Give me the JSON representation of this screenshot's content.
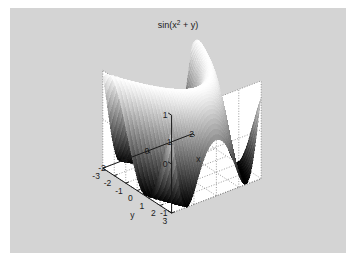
{
  "figure": {
    "title_base": "sin(x",
    "title_exp": "2",
    "title_tail": " + y)",
    "background_color": "#d4d4d4",
    "wall_color": "#ffffff",
    "grid_color": "#5a5a5a",
    "axis_color": "#1a1a1a",
    "colormap": "gray"
  },
  "axes": {
    "x": {
      "label": "x",
      "ticks": [
        -2,
        -1,
        0,
        1,
        2
      ],
      "tick_labels": [
        "-2",
        "-1",
        "0",
        "1",
        "2"
      ],
      "limits": [
        -2,
        2
      ]
    },
    "y": {
      "label": "y",
      "ticks": [
        -3,
        -2,
        -1,
        0,
        1,
        2,
        3
      ],
      "tick_labels": [
        "-3",
        "-2",
        "-1",
        "0",
        "1",
        "2",
        "3"
      ],
      "limits": [
        -3,
        3
      ]
    },
    "z": {
      "label": "",
      "ticks": [
        -1,
        0,
        1
      ],
      "tick_labels": [
        "-1",
        "0",
        "1"
      ],
      "limits": [
        -1,
        1
      ]
    }
  },
  "chart_data": {
    "type": "surface",
    "xlabel": "x",
    "ylabel": "y",
    "zlabel": "",
    "function": "sin(x^2 + y)",
    "xlim": [
      -2,
      2
    ],
    "ylim": [
      -3,
      3
    ],
    "zlim": [
      -1,
      1
    ],
    "x_ticks": [
      -2,
      -1,
      0,
      1,
      2
    ],
    "y_ticks": [
      -3,
      -2,
      -1,
      0,
      1,
      2,
      3
    ],
    "z_ticks": [
      -1,
      0,
      1
    ],
    "grid": true,
    "legend": null,
    "colormap": "gray",
    "shading": "faceted",
    "grid_n_x": 61,
    "grid_n_y": 61,
    "view_azimuth": -37.5,
    "view_elevation": 30,
    "x": [
      -2,
      -1.6667,
      -1.3333,
      -1,
      -0.6667,
      -0.3333,
      0,
      0.3333,
      0.6667,
      1,
      1.3333,
      1.6667,
      2
    ],
    "y": [
      -3,
      -2.5,
      -2,
      -1.5,
      -1,
      -0.5,
      0,
      0.5,
      1,
      1.5,
      2,
      2.5,
      3
    ],
    "z_rows": [
      [
        0.8415,
        0.2709,
        -0.3272,
        -0.8074,
        -0.9993,
        -0.8545,
        -0.4161,
        0.1577,
        0.6755,
        0.9738,
        0.9454,
        0.5985,
        0.0353
      ],
      [
        0.9975,
        0.6131,
        0.0664,
        -0.5064,
        -0.9037,
        -0.9989,
        -0.7568,
        -0.2474,
        0.3137,
        0.7985,
        0.9992,
        0.8716,
        0.4121
      ],
      [
        0.9093,
        0.8632,
        0.4376,
        -0.1002,
        -0.6184,
        -0.9393,
        -0.9589,
        -0.6082,
        -0.0875,
        0.4575,
        0.857,
        0.9993,
        0.7568
      ],
      [
        0.5985,
        0.9962,
        0.7626,
        0.3272,
        -0.2151,
        -0.7118,
        -0.9975,
        -0.8716,
        -0.4794,
        0.0332,
        0.5487,
        0.8979,
        0.9738
      ],
      [
        0.1411,
        0.9194,
        0.9614,
        0.6816,
        0.2151,
        -0.3272,
        -0.9093,
        -0.9894,
        -0.7885,
        -0.3875,
        0.1577,
        0.6313,
        0.9093
      ],
      [
        -0.3508,
        0.6313,
        0.9989,
        0.9093,
        0.5985,
        0.1056,
        -0.6816,
        -0.9686,
        -0.9661,
        -0.7157,
        -0.2474,
        0.2474,
        0.6755
      ],
      [
        -0.7568,
        0.2151,
        0.8979,
        0.9999,
        0.8716,
        0.5155,
        -0.3272,
        -0.7985,
        -0.9993,
        -0.9391,
        -0.6002,
        -0.1577,
        0.3137
      ],
      [
        -0.9775,
        -0.2474,
        0.6313,
        0.9589,
        0.9962,
        0.8415,
        0.0664,
        -0.4794,
        -0.8716,
        -0.9993,
        -0.8545,
        -0.5487,
        -0.0875
      ],
      [
        -0.9589,
        -0.6513,
        0.2474,
        0.7568,
        0.9614,
        0.9962,
        0.4376,
        -0.0664,
        -0.5985,
        -0.9093,
        -0.9728,
        -0.8545,
        -0.4794
      ],
      [
        -0.7055,
        -0.9194,
        -0.1987,
        0.4121,
        0.7568,
        0.9738,
        0.7568,
        0.3508,
        -0.1577,
        -0.6313,
        -0.9093,
        -0.9894,
        -0.7985
      ],
      [
        -0.2794,
        -0.9894,
        -0.6002,
        0.0,
        0.4161,
        0.7568,
        0.9589,
        0.7118,
        0.3137,
        -0.2108,
        -0.6755,
        -0.9661,
        -0.9661
      ],
      [
        0.2151,
        -0.8545,
        -0.8716,
        -0.4161,
        0.0,
        0.4161,
        0.9989,
        0.9391,
        0.6755,
        0.2474,
        -0.3137,
        -0.7985,
        -0.9993
      ],
      [
        0.657,
        -0.4794,
        -0.9993,
        -0.7568,
        -0.4161,
        0.0,
        0.9093,
        0.9991,
        0.9093,
        0.6313,
        0.1411,
        -0.4794,
        -0.9093
      ]
    ]
  }
}
